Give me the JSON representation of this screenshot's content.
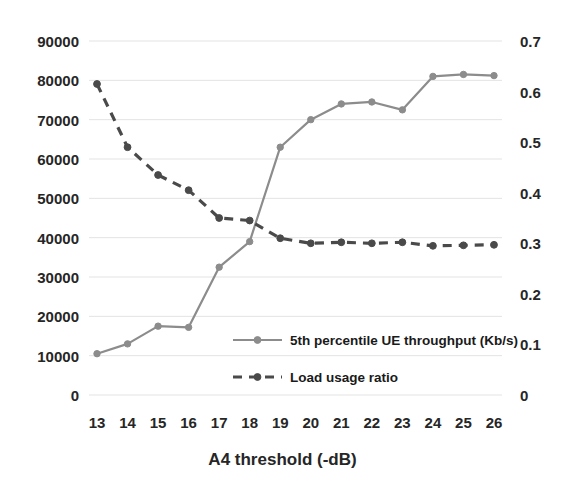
{
  "chart_data": {
    "type": "line",
    "title": "",
    "xlabel": "A4 threshold (-dB)",
    "ylabel": "",
    "categories": [
      "13",
      "14",
      "15",
      "16",
      "17",
      "18",
      "19",
      "20",
      "21",
      "22",
      "23",
      "24",
      "25",
      "26"
    ],
    "x": [
      13,
      14,
      15,
      16,
      17,
      18,
      19,
      20,
      21,
      22,
      23,
      24,
      25,
      26
    ],
    "grid": true,
    "legend_position": "inside-center-bottom",
    "axes": {
      "left": {
        "ticks": [
          "0",
          "10000",
          "20000",
          "30000",
          "40000",
          "50000",
          "60000",
          "70000",
          "80000",
          "90000"
        ],
        "tick_values": [
          0,
          10000,
          20000,
          30000,
          40000,
          50000,
          60000,
          70000,
          80000,
          90000
        ],
        "ylim": [
          0,
          90000
        ]
      },
      "right": {
        "ticks": [
          "0",
          "0.1",
          "0.2",
          "0.3",
          "0.4",
          "0.5",
          "0.6",
          "0.7"
        ],
        "tick_values": [
          0,
          0.1,
          0.2,
          0.3,
          0.4,
          0.5,
          0.6,
          0.7
        ],
        "ylim": [
          0,
          0.7
        ]
      },
      "x": {
        "ticks": [
          "13",
          "14",
          "15",
          "16",
          "17",
          "18",
          "19",
          "20",
          "21",
          "22",
          "23",
          "24",
          "25",
          "26"
        ]
      }
    },
    "series": [
      {
        "name": "5th percentile UE throughput (Kb/s)",
        "axis": "left",
        "style": "solid",
        "color": "#8c8c8c",
        "marker": "circle",
        "values": [
          10500,
          13000,
          17500,
          17200,
          32500,
          39000,
          63000,
          70000,
          74000,
          74500,
          72500,
          81000,
          81500,
          81200
        ]
      },
      {
        "name": "Load usage ratio",
        "axis": "right",
        "style": "dashed",
        "color": "#4a4a4a",
        "marker": "circle",
        "values": [
          0.615,
          0.49,
          0.435,
          0.405,
          0.35,
          0.345,
          0.31,
          0.3,
          0.302,
          0.3,
          0.302,
          0.295,
          0.296,
          0.297
        ]
      }
    ]
  },
  "colors": {
    "series_throughput": "#8c8c8c",
    "series_load": "#4a4a4a",
    "gridline": "#e3e3e3",
    "text": "#262626",
    "background": "#ffffff"
  }
}
